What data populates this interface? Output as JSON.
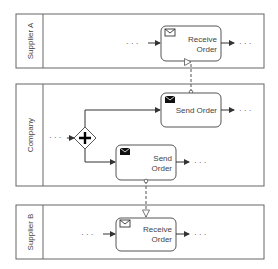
{
  "diagram": {
    "type": "BPMN collaboration",
    "colors": {
      "stroke": "#555555",
      "text": "#444444",
      "background": "#ffffff"
    },
    "pools": [
      {
        "id": "supplier-a",
        "label": "Supplier A"
      },
      {
        "id": "company",
        "label": "Company"
      },
      {
        "id": "supplier-b",
        "label": "Supplier B"
      }
    ],
    "tasks": [
      {
        "id": "receive-a",
        "pool": "Supplier A",
        "line1": "Receive",
        "line2": "Order",
        "icon": "envelope-outline-icon"
      },
      {
        "id": "send-top",
        "pool": "Company",
        "line1": "Send Order",
        "icon": "envelope-filled-icon"
      },
      {
        "id": "send-bottom",
        "pool": "Company",
        "line1": "Send",
        "line2": "Order",
        "icon": "envelope-filled-icon"
      },
      {
        "id": "receive-b",
        "pool": "Supplier B",
        "line1": "Receive",
        "line2": "Order",
        "icon": "envelope-outline-icon"
      }
    ],
    "gateway": {
      "type": "parallel",
      "symbol": "+"
    },
    "ellipsis": "· · ·",
    "message_flows": [
      {
        "from": "Send Order (top)",
        "to": "Receive Order (Supplier A)"
      },
      {
        "from": "Send Order (bottom)",
        "to": "Receive Order (Supplier B)"
      }
    ]
  }
}
